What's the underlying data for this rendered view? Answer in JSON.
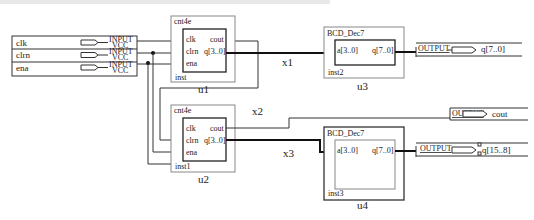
{
  "diagram": {
    "type": "schematic",
    "inputs": [
      {
        "name": "clk",
        "kind": "INPUT",
        "supply": "VCC"
      },
      {
        "name": "clrn",
        "kind": "INPUT",
        "supply": "VCC"
      },
      {
        "name": "ena",
        "kind": "INPUT",
        "supply": "VCC"
      }
    ],
    "components": {
      "u1": {
        "type": "cnt4e",
        "inst": "inst",
        "label": "u1",
        "ports_in": [
          "clk",
          "clrn",
          "ena"
        ],
        "ports_out": [
          "cout",
          "q[3..0]"
        ]
      },
      "u2": {
        "type": "cnt4e",
        "inst": "inst1",
        "label": "u2",
        "ports_in": [
          "clk",
          "clrn",
          "ena"
        ],
        "ports_out": [
          "cout",
          "q[3..0]"
        ]
      },
      "u3": {
        "type": "BCD_Dec7",
        "inst": "inst2",
        "label": "u3",
        "port_in": "a[3..0]",
        "port_out": "q[7..0]"
      },
      "u4": {
        "type": "BCD_Dec7",
        "inst": "inst3",
        "label": "u4",
        "port_in": "a[3..0]",
        "port_out": "q[7..0]"
      }
    },
    "nets": {
      "x1": "x1",
      "x2": "x2",
      "x3": "x3"
    },
    "outputs": [
      {
        "kind": "OUTPUT",
        "name": "q[7..0]"
      },
      {
        "kind": "OUTPUT",
        "name": "cout"
      },
      {
        "kind": "OUTPUT",
        "name": "q[15..8]"
      }
    ]
  }
}
